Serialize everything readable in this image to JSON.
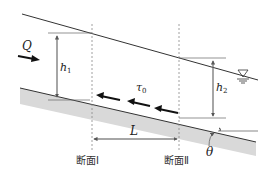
{
  "diagram": {
    "type": "open-channel-uniform-flow",
    "labels": {
      "discharge": "Q",
      "depth1_main": "h",
      "depth1_sub": "1",
      "depth2_main": "h",
      "depth2_sub": "2",
      "shear_main": "τ",
      "shear_sub": "0",
      "length": "L",
      "angle": "θ",
      "section1": "断面Ⅰ",
      "section2": "断面Ⅱ"
    },
    "symbols": {
      "water_surface": "free-surface-triangle"
    },
    "colors": {
      "line": "#333333",
      "bed_fill": "#d9d9d9",
      "dim_line": "#666666"
    }
  }
}
